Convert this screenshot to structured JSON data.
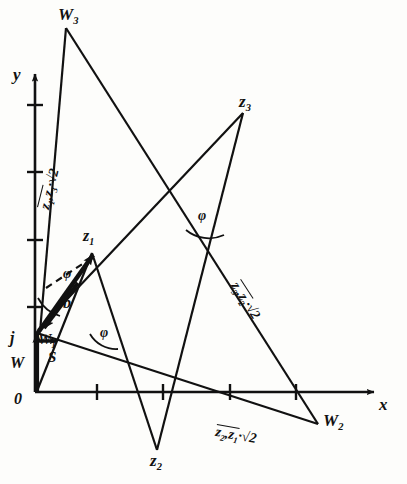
{
  "figure": {
    "kind": "hand-drawn vector / phasor construction diagram",
    "background_color": "#fdfdfb",
    "ink_color": "#111111"
  },
  "axes": {
    "origin_label": "0",
    "x_label": "x",
    "y_label": "y",
    "x_ticks": 4,
    "y_ticks": 4
  },
  "points": {
    "w3": "W3",
    "w2": "W2",
    "w1": "W1",
    "w": "W",
    "z1": "z1",
    "z2": "z2",
    "z3": "z3",
    "j": "j",
    "s": "S"
  },
  "segment_labels": {
    "z1z3": {
      "prefix": "z1,z3",
      "suffix": "·√2"
    },
    "z3z2": {
      "prefix": "z3,z2",
      "suffix": "·√2"
    },
    "z2z1": {
      "prefix": "z2,z1",
      "suffix": "·√2"
    }
  },
  "angles": {
    "phi_origin": "φ",
    "phi_mid": "φ",
    "phi_right": "φ"
  },
  "annotations": {
    "b": "b"
  }
}
